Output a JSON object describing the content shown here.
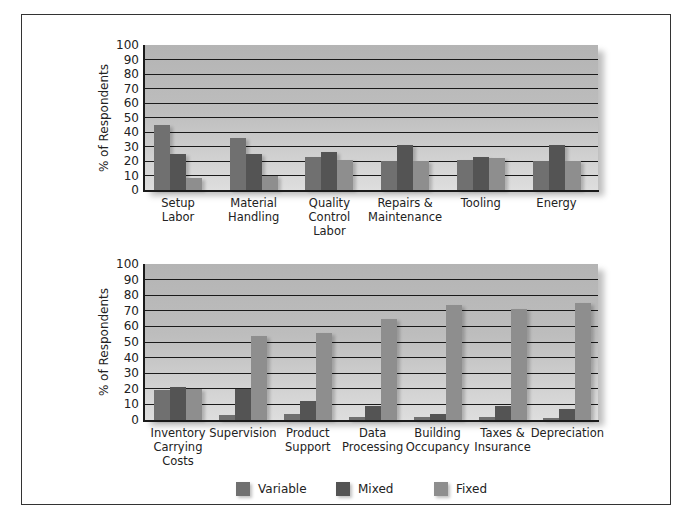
{
  "colors": {
    "variable": "#707070",
    "mixed": "#545454",
    "fixed": "#8e8e8e"
  },
  "legend": [
    {
      "key": "variable",
      "label": "Variable"
    },
    {
      "key": "mixed",
      "label": "Mixed"
    },
    {
      "key": "fixed",
      "label": "Fixed"
    }
  ],
  "chart_data": [
    {
      "type": "bar",
      "title": "",
      "xlabel": "",
      "ylabel": "% of Respondents",
      "ylim": [
        0,
        100
      ],
      "yticks": [
        0,
        10,
        20,
        30,
        40,
        50,
        60,
        70,
        80,
        90,
        100
      ],
      "grid": true,
      "legend_position": "bottom",
      "categories": [
        "Setup Labor",
        "Material Handling",
        "Quality Control Labor",
        "Repairs & Maintenance",
        "Tooling",
        "Energy"
      ],
      "category_lines": [
        [
          "Setup",
          "Labor"
        ],
        [
          "Material",
          "Handling"
        ],
        [
          "Quality",
          "Control",
          "Labor"
        ],
        [
          "Repairs &",
          "Maintenance"
        ],
        [
          "Tooling"
        ],
        [
          "Energy"
        ]
      ],
      "series": [
        {
          "name": "Variable",
          "values": [
            45,
            36,
            23,
            20,
            21,
            20
          ]
        },
        {
          "name": "Mixed",
          "values": [
            25,
            25,
            26,
            31,
            23,
            31
          ]
        },
        {
          "name": "Fixed",
          "values": [
            8,
            10,
            21,
            20,
            22,
            20
          ]
        }
      ]
    },
    {
      "type": "bar",
      "title": "",
      "xlabel": "",
      "ylabel": "% of Respondents",
      "ylim": [
        0,
        100
      ],
      "yticks": [
        0,
        10,
        20,
        30,
        40,
        50,
        60,
        70,
        80,
        90,
        100
      ],
      "grid": true,
      "legend_position": "bottom",
      "categories": [
        "Inventory Carrying Costs",
        "Supervision",
        "Product Support",
        "Data Processing",
        "Building Occupancy",
        "Taxes & Insurance",
        "Depreciation"
      ],
      "category_lines": [
        [
          "Inventory",
          "Carrying",
          "Costs"
        ],
        [
          "Supervision"
        ],
        [
          "Product",
          "Support"
        ],
        [
          "Data",
          "Processing"
        ],
        [
          "Building",
          "Occupancy"
        ],
        [
          "Taxes &",
          "Insurance"
        ],
        [
          "Depreciation"
        ]
      ],
      "series": [
        {
          "name": "Variable",
          "values": [
            19,
            3,
            4,
            2,
            2,
            2,
            1
          ]
        },
        {
          "name": "Mixed",
          "values": [
            21,
            20,
            12,
            9,
            4,
            9,
            7
          ]
        },
        {
          "name": "Fixed",
          "values": [
            20,
            54,
            56,
            65,
            74,
            71,
            75
          ]
        }
      ]
    }
  ]
}
